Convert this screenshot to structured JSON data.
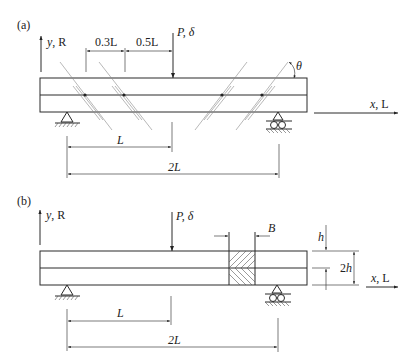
{
  "figure": {
    "panel_a": {
      "label": "(a)",
      "y_axis_label": "y, R",
      "x_axis_label": "x, L",
      "load_label": "P, δ",
      "angle_label": "θ",
      "spacing_1": "0.3L",
      "spacing_2": "0.5L",
      "dim_L": "L",
      "dim_2L": "2L"
    },
    "panel_b": {
      "label": "(b)",
      "y_axis_label": "y, R",
      "x_axis_label": "x, L",
      "load_label": "P, δ",
      "width_label": "B",
      "h_label": "h",
      "two_h_label": "2h",
      "dim_L": "L",
      "dim_2L": "2L"
    }
  }
}
